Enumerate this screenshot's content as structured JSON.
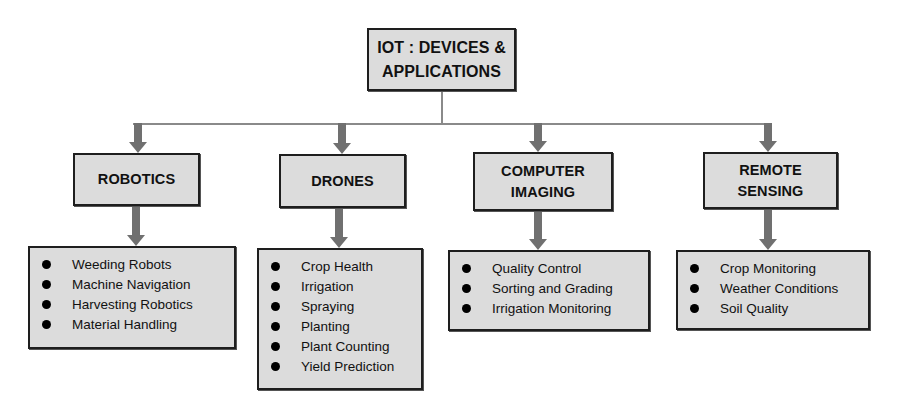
{
  "diagram": {
    "root": {
      "label_line1": "IOT : DEVICES &",
      "label_line2": "APPLICATIONS"
    },
    "colors": {
      "box_fill": "#dcdcdc",
      "box_border": "#1e1e1e",
      "arrow": "#707070",
      "connector": "#8a8a8a"
    },
    "categories": [
      {
        "title_line1": "ROBOTICS",
        "title_line2": "",
        "items": [
          "Weeding Robots",
          "Machine Navigation",
          "Harvesting Robotics",
          "Material Handling"
        ]
      },
      {
        "title_line1": "DRONES",
        "title_line2": "",
        "items": [
          "Crop Health",
          "Irrigation",
          "Spraying",
          "Planting",
          "Plant Counting",
          "Yield Prediction"
        ]
      },
      {
        "title_line1": "COMPUTER",
        "title_line2": "IMAGING",
        "items": [
          "Quality Control",
          "Sorting and Grading",
          "Irrigation Monitoring"
        ]
      },
      {
        "title_line1": "REMOTE",
        "title_line2": "SENSING",
        "items": [
          "Crop Monitoring",
          "Weather Conditions",
          "Soil Quality"
        ]
      }
    ]
  }
}
